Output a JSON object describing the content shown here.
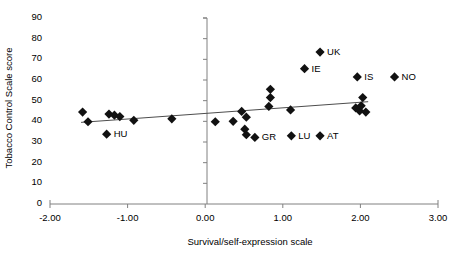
{
  "chart_data": {
    "type": "scatter",
    "title": "",
    "xlabel": "Survival/self-expression scale",
    "ylabel": "Tobacco Control Scale score",
    "xlim": [
      -2.0,
      3.0
    ],
    "ylim": [
      0,
      90
    ],
    "xticks": [
      "-2.00",
      "-1.00",
      "0.00",
      "1.00",
      "2.00",
      "3.00"
    ],
    "xtick_values": [
      -2.0,
      -1.0,
      0.0,
      1.0,
      2.0,
      3.0
    ],
    "yticks": [
      "0",
      "10",
      "20",
      "30",
      "40",
      "50",
      "60",
      "70",
      "80",
      "90"
    ],
    "ytick_values": [
      0,
      10,
      20,
      30,
      40,
      50,
      60,
      70,
      80,
      90
    ],
    "grid": false,
    "legend": "none",
    "marker": "diamond",
    "marker_color": "#111111",
    "axis_color": "#808080",
    "trendline": {
      "visible": true,
      "color": "#4d4d4d",
      "x_start": -1.6,
      "y_start": 39.5,
      "x_end": 2.1,
      "y_end": 49.5
    },
    "points": [
      {
        "label": "",
        "x": -1.58,
        "y": 44.5
      },
      {
        "label": "",
        "x": -1.51,
        "y": 39.8
      },
      {
        "label": "",
        "x": -1.24,
        "y": 43.5
      },
      {
        "label": "",
        "x": -1.17,
        "y": 43.0
      },
      {
        "label": "",
        "x": -1.1,
        "y": 42.3
      },
      {
        "label": "",
        "x": -0.92,
        "y": 40.5
      },
      {
        "label": "HU",
        "x": -1.27,
        "y": 33.8
      },
      {
        "label": "",
        "x": -0.43,
        "y": 41.2
      },
      {
        "label": "",
        "x": 0.13,
        "y": 39.8
      },
      {
        "label": "",
        "x": 0.36,
        "y": 40.0
      },
      {
        "label": "",
        "x": 0.47,
        "y": 44.8
      },
      {
        "label": "",
        "x": 0.53,
        "y": 42.0
      },
      {
        "label": "",
        "x": 0.51,
        "y": 36.2
      },
      {
        "label": "",
        "x": 0.53,
        "y": 33.5
      },
      {
        "label": "GR",
        "x": 0.64,
        "y": 32.2
      },
      {
        "label": "",
        "x": 0.84,
        "y": 55.5
      },
      {
        "label": "",
        "x": 0.84,
        "y": 51.5
      },
      {
        "label": "",
        "x": 0.82,
        "y": 47.2
      },
      {
        "label": "",
        "x": 1.1,
        "y": 45.5
      },
      {
        "label": "LU",
        "x": 1.11,
        "y": 33.0
      },
      {
        "label": "AT",
        "x": 1.48,
        "y": 33.0
      },
      {
        "label": "UK",
        "x": 1.48,
        "y": 73.5
      },
      {
        "label": "IE",
        "x": 1.28,
        "y": 65.5
      },
      {
        "label": "IS",
        "x": 1.96,
        "y": 61.5
      },
      {
        "label": "NO",
        "x": 2.44,
        "y": 61.5
      },
      {
        "label": "",
        "x": 1.94,
        "y": 46.5
      },
      {
        "label": "",
        "x": 1.99,
        "y": 45.0
      },
      {
        "label": "",
        "x": 2.07,
        "y": 44.5
      },
      {
        "label": "",
        "x": 2.01,
        "y": 47.5
      },
      {
        "label": "",
        "x": 2.03,
        "y": 51.5
      }
    ]
  }
}
